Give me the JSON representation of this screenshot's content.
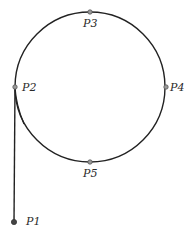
{
  "diagram": {
    "colors": {
      "stroke": "#222222",
      "point_fill": "#9a9a9a",
      "point_stroke": "#555555",
      "p1_fill": "#444444"
    },
    "circle": {
      "cx": 90,
      "cy": 87,
      "r": 75
    },
    "points": [
      {
        "id": "P1",
        "label": "P1",
        "x": 14,
        "y": 222,
        "label_x": 26,
        "label_y": 225
      },
      {
        "id": "P2",
        "label": "P2",
        "x": 15,
        "y": 87,
        "label_x": 22,
        "label_y": 91
      },
      {
        "id": "P3",
        "label": "P3",
        "x": 90,
        "y": 12,
        "label_x": 83,
        "label_y": 27
      },
      {
        "id": "P4",
        "label": "P4",
        "x": 166,
        "y": 87,
        "label_x": 170,
        "label_y": 91
      },
      {
        "id": "P5",
        "label": "P5",
        "x": 90,
        "y": 162,
        "label_x": 83,
        "label_y": 177
      }
    ]
  }
}
